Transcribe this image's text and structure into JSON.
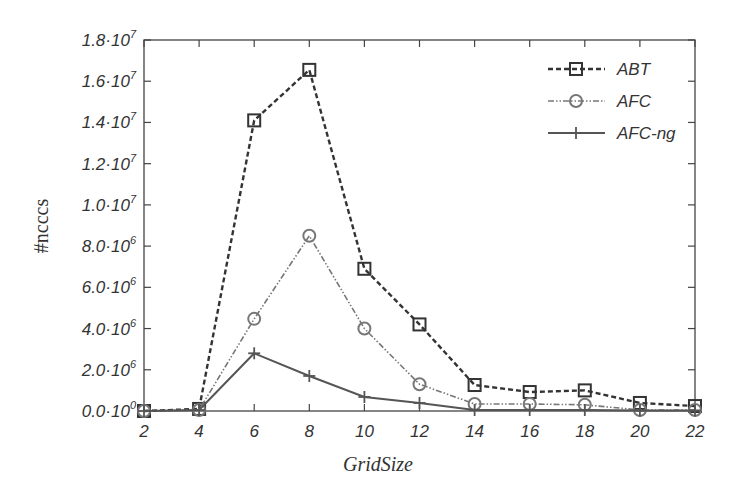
{
  "chart_data": {
    "type": "line",
    "title": "",
    "xlabel": "GridSize",
    "ylabel": "#ncccs",
    "x": [
      2,
      4,
      6,
      8,
      10,
      12,
      14,
      16,
      18,
      20,
      22
    ],
    "xlim": [
      2,
      22
    ],
    "ylim": [
      0,
      18000000
    ],
    "xticks": [
      "2",
      "4",
      "6",
      "8",
      "10",
      "12",
      "14",
      "16",
      "18",
      "20",
      "22"
    ],
    "yticks": [
      {
        "value": 0,
        "mantissa": "0.0",
        "exp": "0"
      },
      {
        "value": 2000000,
        "mantissa": "2.0",
        "exp": "6"
      },
      {
        "value": 4000000,
        "mantissa": "4.0",
        "exp": "6"
      },
      {
        "value": 6000000,
        "mantissa": "6.0",
        "exp": "6"
      },
      {
        "value": 8000000,
        "mantissa": "8.0",
        "exp": "6"
      },
      {
        "value": 10000000,
        "mantissa": "1.0",
        "exp": "7"
      },
      {
        "value": 12000000,
        "mantissa": "1.2",
        "exp": "7"
      },
      {
        "value": 14000000,
        "mantissa": "1.4",
        "exp": "7"
      },
      {
        "value": 16000000,
        "mantissa": "1.6",
        "exp": "7"
      },
      {
        "value": 18000000,
        "mantissa": "1.8",
        "exp": "7"
      }
    ],
    "grid": false,
    "legend_position": "upper right",
    "series": [
      {
        "name": "ABT",
        "marker": "square",
        "line": "dashed",
        "color": "#333333",
        "values": [
          0,
          100000,
          14100000,
          16550000,
          6900000,
          4200000,
          1260000,
          920000,
          1000000,
          390000,
          240000
        ]
      },
      {
        "name": "AFC",
        "marker": "circle",
        "line": "dash-dot",
        "color": "#777777",
        "values": [
          0,
          50000,
          4470000,
          8500000,
          4000000,
          1300000,
          340000,
          340000,
          300000,
          50000,
          50000
        ]
      },
      {
        "name": "AFC-ng",
        "marker": "plus",
        "line": "solid",
        "color": "#555555",
        "values": [
          0,
          50000,
          2800000,
          1700000,
          680000,
          390000,
          50000,
          50000,
          50000,
          30000,
          30000
        ]
      }
    ]
  },
  "legend": {
    "items": [
      {
        "label": "ABT"
      },
      {
        "label": "AFC"
      },
      {
        "label": "AFC-ng"
      }
    ]
  }
}
